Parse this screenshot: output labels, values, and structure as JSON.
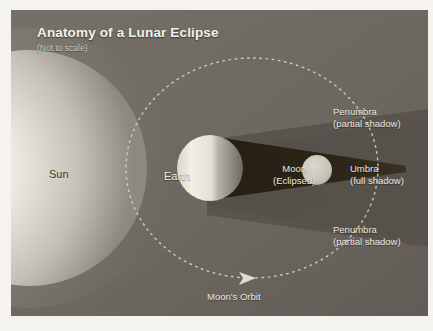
{
  "figure": {
    "title": "Anatomy of a Lunar Eclipse",
    "subtitle": "(Not to scale)",
    "panel_color": "#6e6a63",
    "border_color": "#f4f3f0"
  },
  "labels": {
    "sun": "Sun",
    "earth": "Earth",
    "moon_line1": "Moon",
    "moon_line2": "(Eclipsed)",
    "umbra_line1": "Umbra",
    "umbra_line2": "(full shadow)",
    "penumbra_top_line1": "Penumbra",
    "penumbra_top_line2": "(partial shadow)",
    "penumbra_bottom_line1": "Penumbra",
    "penumbra_bottom_line2": "(partial shadow)",
    "orbit": "Moon's Orbit"
  },
  "colors": {
    "umbra": "#2b2317",
    "penumbra": "#56514a",
    "background": "#6e6a63",
    "sun_core": "#f7f5ef",
    "sun_edge": "#8d8880",
    "earth_lit": "#efece4",
    "earth_dark": "#6b665e",
    "moon_disk": "#c9c5bb",
    "orbit_dash": "#d8d4cb",
    "label_text": "#ece9e3",
    "dark_label_text": "#3b3731"
  },
  "bodies": {
    "sun": {
      "cx": 30,
      "cy": 165,
      "r": 118
    },
    "earth": {
      "cx": 210,
      "cy": 168,
      "r": 33
    },
    "moon": {
      "cx": 317,
      "cy": 170,
      "r": 15
    }
  },
  "orbit": {
    "cx": 252,
    "cy": 165,
    "rx": 126,
    "ry": 110,
    "dash_style": "dotted",
    "arrow_direction": "clockwise-right"
  }
}
